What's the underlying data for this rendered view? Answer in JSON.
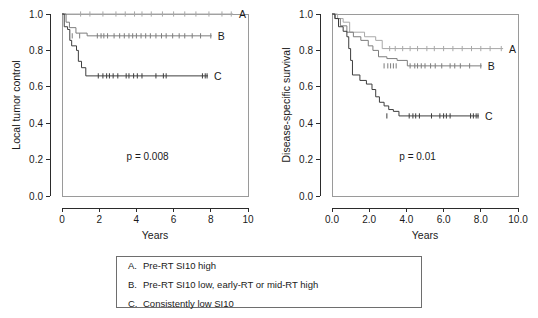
{
  "figure": {
    "panels": [
      {
        "id": "local-tumor-control",
        "ylabel": "Local tumor control",
        "xlabel": "Years",
        "pvalue": "p = 0.008",
        "xticks": [
          "0",
          "2",
          "4",
          "6",
          "8",
          "10"
        ],
        "yticks": [
          "0.0",
          "0.2",
          "0.4",
          "0.6",
          "0.8",
          "1.0"
        ],
        "curve_labels": {
          "a": "A",
          "b": "B",
          "c": "C"
        }
      },
      {
        "id": "disease-specific-survival",
        "ylabel": "Disease-specific survival",
        "xlabel": "Years",
        "pvalue": "p = 0.01",
        "xticks": [
          "0.0",
          "2.0",
          "4.0",
          "6.0",
          "8.0",
          "10.0"
        ],
        "yticks": [
          "0.0",
          "0.2",
          "0.4",
          "0.6",
          "0.8",
          "1.0"
        ],
        "curve_labels": {
          "a": "A",
          "b": "B",
          "c": "C"
        }
      }
    ]
  },
  "legend": {
    "rows": [
      {
        "key": "A.",
        "text": "Pre-RT SI10 high"
      },
      {
        "key": "B.",
        "text": "Pre-RT SI10 low, early-RT or mid-RT high"
      },
      {
        "key": "C.",
        "text": "Consistently low SI10"
      }
    ]
  },
  "colors": {
    "curve_a": "#a8a8a8",
    "curve_b": "#7d7d7d",
    "curve_c": "#3d3d3d",
    "axis": "#2b2b2b",
    "frame": "#9a9a9a"
  },
  "chart_data": [
    {
      "type": "line",
      "subtype": "kaplan-meier-step",
      "title": "Local tumor control",
      "xlabel": "Years",
      "ylabel": "Local tumor control",
      "xlim": [
        0,
        10
      ],
      "ylim": [
        0.0,
        1.0
      ],
      "xticks": [
        0,
        2,
        4,
        6,
        8,
        10
      ],
      "yticks": [
        0.0,
        0.2,
        0.4,
        0.6,
        0.8,
        1.0
      ],
      "grid": false,
      "legend_position": "curve-end-labels",
      "annotations": [
        {
          "text": "p = 0.008",
          "x": 4.6,
          "y": 0.2
        }
      ],
      "series": [
        {
          "name": "A",
          "label": "Pre-RT SI10 high",
          "color": "#a8a8a8",
          "steps": [
            [
              0.0,
              1.0
            ],
            [
              9.2,
              1.0
            ]
          ],
          "censor_times": [
            1.0,
            1.5,
            2.2,
            2.9,
            3.4,
            3.9,
            4.3,
            4.8,
            5.4,
            6.0,
            6.6,
            7.2,
            7.9,
            8.6,
            9.1
          ],
          "censor_value": 1.0
        },
        {
          "name": "B",
          "label": "Pre-RT SI10 low, early-RT or mid-RT high",
          "color": "#7d7d7d",
          "steps": [
            [
              0.0,
              1.0
            ],
            [
              0.22,
              1.0
            ],
            [
              0.22,
              0.955
            ],
            [
              0.4,
              0.955
            ],
            [
              0.4,
              0.925
            ],
            [
              0.75,
              0.925
            ],
            [
              0.75,
              0.895
            ],
            [
              1.35,
              0.895
            ],
            [
              1.35,
              0.88
            ],
            [
              8.05,
              0.88
            ]
          ],
          "censor_times": [
            0.55,
            0.95,
            1.9,
            2.1,
            2.25,
            2.45,
            2.8,
            3.1,
            3.35,
            3.6,
            3.8,
            4.0,
            4.25,
            4.5,
            4.75,
            5.05,
            5.35,
            5.6,
            5.95,
            6.3,
            6.6,
            7.0,
            7.45,
            8.0
          ],
          "censor_value": 0.88
        },
        {
          "name": "C",
          "label": "Consistently low SI10",
          "color": "#3d3d3d",
          "steps": [
            [
              0.0,
              1.0
            ],
            [
              0.12,
              1.0
            ],
            [
              0.12,
              0.93
            ],
            [
              0.3,
              0.93
            ],
            [
              0.3,
              0.915
            ],
            [
              0.42,
              0.915
            ],
            [
              0.42,
              0.855
            ],
            [
              0.52,
              0.855
            ],
            [
              0.52,
              0.825
            ],
            [
              0.78,
              0.825
            ],
            [
              0.78,
              0.8
            ],
            [
              0.88,
              0.8
            ],
            [
              0.88,
              0.74
            ],
            [
              1.05,
              0.74
            ],
            [
              1.05,
              0.705
            ],
            [
              1.28,
              0.705
            ],
            [
              1.28,
              0.66
            ],
            [
              7.85,
              0.66
            ]
          ],
          "censor_times": [
            1.95,
            2.2,
            2.4,
            2.55,
            2.75,
            3.0,
            3.45,
            3.6,
            3.85,
            4.05,
            4.3,
            5.05,
            5.45,
            5.6,
            7.55,
            7.7,
            7.8
          ],
          "censor_value": 0.66
        }
      ]
    },
    {
      "type": "line",
      "subtype": "kaplan-meier-step",
      "title": "Disease-specific survival",
      "xlabel": "Years",
      "ylabel": "Disease-specific survival",
      "xlim": [
        0,
        10
      ],
      "ylim": [
        0.0,
        1.0
      ],
      "xticks": [
        0.0,
        2.0,
        4.0,
        6.0,
        8.0,
        10.0
      ],
      "yticks": [
        0.0,
        0.2,
        0.4,
        0.6,
        0.8,
        1.0
      ],
      "grid": false,
      "legend_position": "curve-end-labels",
      "annotations": [
        {
          "text": "p = 0.01",
          "x": 4.6,
          "y": 0.2
        }
      ],
      "series": [
        {
          "name": "A",
          "label": "Pre-RT SI10 high",
          "color": "#a8a8a8",
          "steps": [
            [
              0.0,
              1.0
            ],
            [
              0.3,
              1.0
            ],
            [
              0.3,
              0.975
            ],
            [
              0.6,
              0.975
            ],
            [
              0.6,
              0.955
            ],
            [
              0.95,
              0.955
            ],
            [
              0.95,
              0.9
            ],
            [
              1.75,
              0.9
            ],
            [
              1.75,
              0.875
            ],
            [
              2.35,
              0.875
            ],
            [
              2.35,
              0.855
            ],
            [
              2.7,
              0.855
            ],
            [
              2.7,
              0.81
            ],
            [
              9.2,
              0.81
            ]
          ],
          "censor_times": [
            3.1,
            3.4,
            3.8,
            4.2,
            4.6,
            5.1,
            5.5,
            6.0,
            6.5,
            7.0,
            7.5,
            8.0,
            8.5,
            9.1
          ],
          "censor_value": 0.81
        },
        {
          "name": "B",
          "label": "Pre-RT SI10 low, early-RT or mid-RT high",
          "color": "#7d7d7d",
          "steps": [
            [
              0.0,
              1.0
            ],
            [
              0.18,
              1.0
            ],
            [
              0.18,
              0.975
            ],
            [
              0.45,
              0.975
            ],
            [
              0.45,
              0.935
            ],
            [
              0.8,
              0.935
            ],
            [
              0.8,
              0.9
            ],
            [
              1.15,
              0.9
            ],
            [
              1.15,
              0.875
            ],
            [
              1.55,
              0.875
            ],
            [
              1.55,
              0.855
            ],
            [
              1.95,
              0.855
            ],
            [
              1.95,
              0.825
            ],
            [
              2.2,
              0.825
            ],
            [
              2.2,
              0.8
            ],
            [
              2.5,
              0.8
            ],
            [
              2.5,
              0.765
            ],
            [
              2.95,
              0.765
            ],
            [
              2.95,
              0.755
            ],
            [
              3.5,
              0.755
            ],
            [
              3.5,
              0.745
            ],
            [
              4.05,
              0.745
            ],
            [
              4.05,
              0.715
            ],
            [
              8.05,
              0.715
            ]
          ],
          "censor_times": [
            2.8,
            3.0,
            3.15,
            3.3,
            3.45,
            4.2,
            4.45,
            4.6,
            4.8,
            5.0,
            5.3,
            5.55,
            5.9,
            6.35,
            6.6,
            6.9,
            7.4,
            8.0
          ],
          "censor_value": 0.715
        },
        {
          "name": "C",
          "label": "Consistently low SI10",
          "color": "#3d3d3d",
          "steps": [
            [
              0.0,
              1.0
            ],
            [
              0.15,
              1.0
            ],
            [
              0.15,
              0.975
            ],
            [
              0.35,
              0.975
            ],
            [
              0.35,
              0.93
            ],
            [
              0.6,
              0.93
            ],
            [
              0.6,
              0.905
            ],
            [
              0.8,
              0.905
            ],
            [
              0.8,
              0.875
            ],
            [
              0.9,
              0.875
            ],
            [
              0.9,
              0.81
            ],
            [
              1.0,
              0.81
            ],
            [
              1.0,
              0.745
            ],
            [
              1.1,
              0.745
            ],
            [
              1.1,
              0.665
            ],
            [
              1.5,
              0.665
            ],
            [
              1.5,
              0.635
            ],
            [
              1.85,
              0.635
            ],
            [
              1.85,
              0.615
            ],
            [
              2.15,
              0.615
            ],
            [
              2.15,
              0.585
            ],
            [
              2.35,
              0.585
            ],
            [
              2.35,
              0.545
            ],
            [
              2.55,
              0.545
            ],
            [
              2.55,
              0.515
            ],
            [
              2.8,
              0.515
            ],
            [
              2.8,
              0.495
            ],
            [
              3.05,
              0.495
            ],
            [
              3.05,
              0.475
            ],
            [
              3.3,
              0.475
            ],
            [
              3.3,
              0.465
            ],
            [
              3.6,
              0.465
            ],
            [
              3.6,
              0.44
            ],
            [
              7.9,
              0.44
            ]
          ],
          "censor_times": [
            2.95,
            4.15,
            4.35,
            4.5,
            4.7,
            5.35,
            5.8,
            6.0,
            6.15,
            6.35,
            7.45,
            7.6,
            7.75,
            7.85
          ],
          "censor_value": 0.44
        }
      ]
    }
  ]
}
